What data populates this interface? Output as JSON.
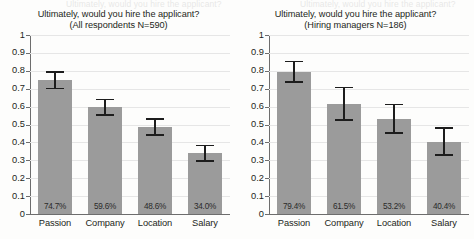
{
  "page": {
    "bleed_text_left": "Ultimately, would you hire the applicant?",
    "bleed_text_right": "Ultimately, would you hire the applicant?"
  },
  "chart_data": [
    {
      "type": "bar",
      "panel": "left",
      "title": "Ultimately, would you hire the applicant?",
      "subtitle": "(All respondents N=590)",
      "xlabel": "",
      "ylabel": "",
      "ylim": [
        0,
        1
      ],
      "yticks": [
        "0",
        "0.1",
        "0.2",
        "0.3",
        "0.4",
        "0.5",
        "0.6",
        "0.7",
        "0.8",
        "0.9",
        "1"
      ],
      "grid": true,
      "legend": "none",
      "categories": [
        "Passion",
        "Company",
        "Location",
        "Salary"
      ],
      "values": [
        0.747,
        0.596,
        0.486,
        0.34
      ],
      "data_labels": [
        "74.7%",
        "59.6%",
        "48.6%",
        "34.0%"
      ],
      "error_low": [
        0.7,
        0.552,
        0.441,
        0.297
      ],
      "error_high": [
        0.793,
        0.64,
        0.531,
        0.383
      ]
    },
    {
      "type": "bar",
      "panel": "right",
      "title": "Ultimately, would you hire the applicant?",
      "subtitle": "(Hiring managers N=186)",
      "xlabel": "",
      "ylabel": "",
      "ylim": [
        0,
        1
      ],
      "yticks": [
        "0",
        "0.1",
        "0.2",
        "0.3",
        "0.4",
        "0.5",
        "0.6",
        "0.7",
        "0.8",
        "0.9",
        "1"
      ],
      "grid": true,
      "legend": "none",
      "categories": [
        "Passion",
        "Company",
        "Location",
        "Salary"
      ],
      "values": [
        0.794,
        0.615,
        0.532,
        0.404
      ],
      "data_labels": [
        "79.4%",
        "61.5%",
        "53.2%",
        "40.4%"
      ],
      "error_low": [
        0.737,
        0.524,
        0.453,
        0.329
      ],
      "error_high": [
        0.851,
        0.706,
        0.611,
        0.479
      ]
    }
  ],
  "colors": {
    "bar_fill": "#9b9b9b",
    "error_bar": "#1d1d1d",
    "gridline": "#e6e6e6",
    "axis": "#6d6d6d",
    "text": "#231f20",
    "background": "#fdfdfc"
  }
}
